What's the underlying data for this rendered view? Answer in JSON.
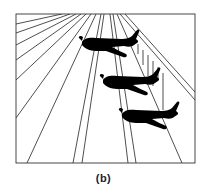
{
  "figure": {
    "caption": "(b)",
    "colors": {
      "line": "#222222",
      "plane": "#000000",
      "background": "#ffffff"
    },
    "frame": {
      "x": 16,
      "y": 14,
      "width": 179,
      "height": 149
    },
    "plane_count": 3
  }
}
